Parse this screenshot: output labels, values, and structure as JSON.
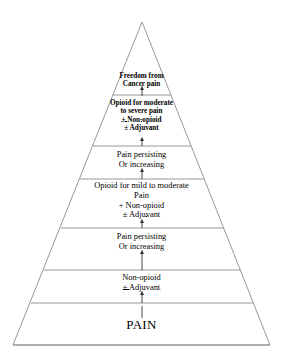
{
  "figure": {
    "name": "who-analgesic-ladder-pyramid",
    "type": "pyramid-diagram",
    "line_color": "#808080",
    "text_color": "#000000",
    "background_color": "#ffffff"
  },
  "apex": {
    "label": "Freedom from",
    "label2": "Cancer pain"
  },
  "step3": {
    "line1": "Opioid for moderate",
    "line2": "to severe pain",
    "line3": "± Non-opioid",
    "line4": "± Adjuvant"
  },
  "transition_upper": {
    "line1": "Pain persisting",
    "line2": "Or increasing"
  },
  "step2": {
    "line1": "Opioid for mild to moderate",
    "line2": "Pain",
    "line3": "+ Non-opioid",
    "line4": "± Adjuvant"
  },
  "transition_lower": {
    "line1": "Pain persisting",
    "line2": "Or increasing"
  },
  "step1": {
    "line1": "Non-opioid",
    "line2": "± Adjuvant"
  },
  "base": {
    "label": "PAIN"
  },
  "arrows": {
    "name": "upward-arrow",
    "count": 6,
    "direction": "up"
  }
}
